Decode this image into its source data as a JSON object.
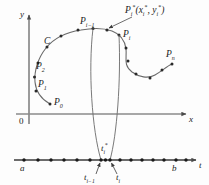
{
  "figure": {
    "background_color": "#fdfdfd",
    "stroke_color": "#4a4a4a",
    "text_color": "#1a1a1a",
    "width": 209,
    "height": 185
  },
  "axes": {
    "y_label": "y",
    "x_label": "x",
    "t_label": "t",
    "origin_label": "0"
  },
  "curve": {
    "name_label": "C",
    "points": [
      {
        "key": "P0",
        "label_html": "P<sub>0</sub>",
        "x": 51,
        "y": 100
      },
      {
        "key": "P1",
        "label_html": "P<sub>1</sub>",
        "x": 44,
        "y": 85
      },
      {
        "key": "P2",
        "label_html": "P<sub>2</sub>",
        "x": 41,
        "y": 68
      },
      {
        "key": "Pi-1",
        "label_html": "P<sub>i−1</sub>",
        "x": 100,
        "y": 28
      },
      {
        "key": "Pi",
        "label_html": "P<sub>i</sub>",
        "x": 122,
        "y": 35
      },
      {
        "key": "Pn",
        "label_html": "P<sub>n</sub>",
        "x": 175,
        "y": 62
      }
    ],
    "sample_point_label_html": "P<sub>i</sub><sup>*</sup>(x<sub>i</sub><sup>*</sup>, y<sub>i</sub><sup>*</sup>)"
  },
  "t_axis": {
    "start_label": "a",
    "end_label": "b",
    "sample_label_html": "t<sub>i</sub><sup>*</sup>",
    "left_tick_label_html": "t<sub>i−1</sub>",
    "right_tick_label_html": "t<sub>i</sub>",
    "tick_count": 17
  }
}
